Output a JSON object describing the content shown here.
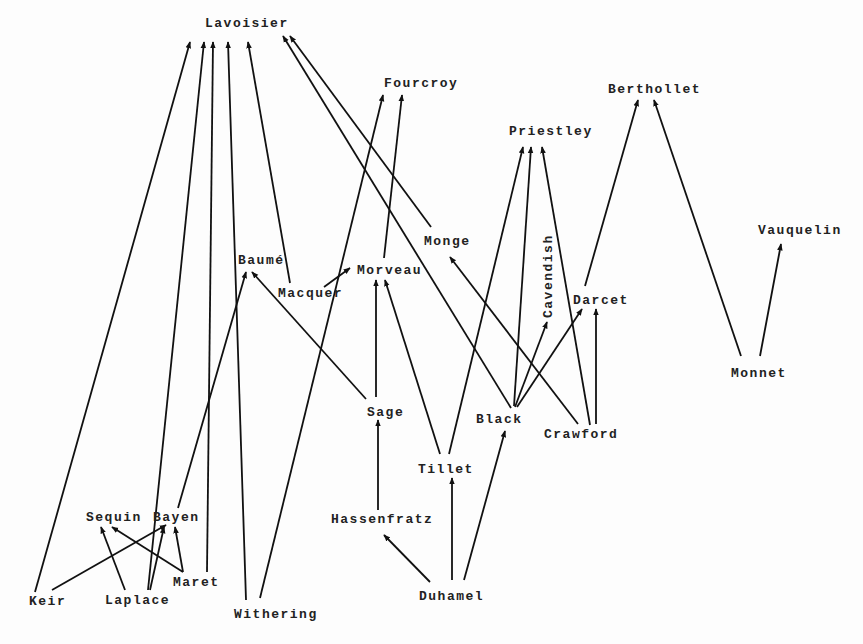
{
  "diagram": {
    "type": "directed-graph",
    "colors": {
      "background": "#fdfdfd",
      "ink": "#111111"
    },
    "nodes": [
      {
        "id": "lavoisier",
        "label": "Lavoisier",
        "x": 205,
        "y": 17
      },
      {
        "id": "fourcroy",
        "label": "Fourcroy",
        "x": 384,
        "y": 77
      },
      {
        "id": "berthollet",
        "label": "Berthollet",
        "x": 608,
        "y": 83
      },
      {
        "id": "priestley",
        "label": "Priestley",
        "x": 509,
        "y": 125
      },
      {
        "id": "vauquelin",
        "label": "Vauquelin",
        "x": 758,
        "y": 224
      },
      {
        "id": "monge",
        "label": "Monge",
        "x": 424,
        "y": 235
      },
      {
        "id": "baume",
        "label": "Baumé",
        "x": 238,
        "y": 254
      },
      {
        "id": "morveau",
        "label": "Morveau",
        "x": 357,
        "y": 264
      },
      {
        "id": "macquer",
        "label": "Macquer",
        "x": 278,
        "y": 287
      },
      {
        "id": "cavendish",
        "label": "Cavendish",
        "x": 542,
        "y": 318,
        "vertical": true
      },
      {
        "id": "darcet",
        "label": "Darcet",
        "x": 573,
        "y": 294
      },
      {
        "id": "monnet",
        "label": "Monnet",
        "x": 731,
        "y": 367
      },
      {
        "id": "sage",
        "label": "Sage",
        "x": 367,
        "y": 406
      },
      {
        "id": "black",
        "label": "Black",
        "x": 476,
        "y": 413
      },
      {
        "id": "crawford",
        "label": "Crawford",
        "x": 544,
        "y": 428
      },
      {
        "id": "tillet",
        "label": "Tillet",
        "x": 418,
        "y": 463
      },
      {
        "id": "sequin",
        "label": "Sequin",
        "x": 86,
        "y": 511
      },
      {
        "id": "bayen",
        "label": "Bayen",
        "x": 153,
        "y": 511
      },
      {
        "id": "hassenfratz",
        "label": "Hassenfratz",
        "x": 331,
        "y": 513
      },
      {
        "id": "maret",
        "label": "Maret",
        "x": 173,
        "y": 576
      },
      {
        "id": "keir",
        "label": "Keir",
        "x": 29,
        "y": 595
      },
      {
        "id": "laplace",
        "label": "Laplace",
        "x": 105,
        "y": 594
      },
      {
        "id": "duhamel",
        "label": "Duhamel",
        "x": 419,
        "y": 590
      },
      {
        "id": "withering",
        "label": "Withering",
        "x": 234,
        "y": 608
      }
    ],
    "edges": [
      {
        "from": "keir",
        "to": "lavoisier",
        "x1": 35,
        "y1": 592,
        "x2": 190,
        "y2": 42
      },
      {
        "from": "laplace",
        "to": "lavoisier",
        "x1": 148,
        "y1": 590,
        "x2": 204,
        "y2": 42
      },
      {
        "from": "maret",
        "to": "lavoisier",
        "x1": 207,
        "y1": 572,
        "x2": 213,
        "y2": 42
      },
      {
        "from": "withering",
        "to": "lavoisier",
        "x1": 246,
        "y1": 600,
        "x2": 228,
        "y2": 42
      },
      {
        "from": "macquer",
        "to": "lavoisier",
        "x1": 290,
        "y1": 283,
        "x2": 248,
        "y2": 42
      },
      {
        "from": "black",
        "to": "lavoisier",
        "x1": 511,
        "y1": 408,
        "x2": 283,
        "y2": 36
      },
      {
        "from": "monge",
        "to": "lavoisier",
        "x1": 431,
        "y1": 227,
        "x2": 290,
        "y2": 36
      },
      {
        "from": "withering",
        "to": "fourcroy",
        "x1": 260,
        "y1": 598,
        "x2": 383,
        "y2": 95
      },
      {
        "from": "morveau",
        "to": "fourcroy",
        "x1": 384,
        "y1": 258,
        "x2": 402,
        "y2": 95
      },
      {
        "from": "macquer",
        "to": "morveau",
        "x1": 324,
        "y1": 287,
        "x2": 350,
        "y2": 268
      },
      {
        "from": "sage",
        "to": "morveau",
        "x1": 376,
        "y1": 397,
        "x2": 376,
        "y2": 280
      },
      {
        "from": "tillet",
        "to": "morveau",
        "x1": 440,
        "y1": 454,
        "x2": 385,
        "y2": 280
      },
      {
        "from": "sage",
        "to": "baume",
        "x1": 366,
        "y1": 399,
        "x2": 252,
        "y2": 272
      },
      {
        "from": "bayen",
        "to": "baume",
        "x1": 178,
        "y1": 508,
        "x2": 246,
        "y2": 272
      },
      {
        "from": "tillet",
        "to": "priestley",
        "x1": 449,
        "y1": 454,
        "x2": 523,
        "y2": 147
      },
      {
        "from": "black",
        "to": "priestley",
        "x1": 514,
        "y1": 406,
        "x2": 531,
        "y2": 147
      },
      {
        "from": "crawford",
        "to": "priestley",
        "x1": 590,
        "y1": 425,
        "x2": 542,
        "y2": 147
      },
      {
        "from": "black",
        "to": "cavendish",
        "x1": 515,
        "y1": 407,
        "x2": 547,
        "y2": 322
      },
      {
        "from": "black",
        "to": "darcet",
        "x1": 517,
        "y1": 407,
        "x2": 582,
        "y2": 309
      },
      {
        "from": "crawford",
        "to": "darcet",
        "x1": 596,
        "y1": 424,
        "x2": 596,
        "y2": 309
      },
      {
        "from": "crawford",
        "to": "monge",
        "x1": 578,
        "y1": 424,
        "x2": 450,
        "y2": 257
      },
      {
        "from": "darcet",
        "to": "berthollet",
        "x1": 585,
        "y1": 286,
        "x2": 638,
        "y2": 100
      },
      {
        "from": "monnet",
        "to": "berthollet",
        "x1": 741,
        "y1": 356,
        "x2": 654,
        "y2": 100
      },
      {
        "from": "monnet",
        "to": "vauquelin",
        "x1": 760,
        "y1": 356,
        "x2": 781,
        "y2": 244
      },
      {
        "from": "duhamel",
        "to": "hassenfratz",
        "x1": 430,
        "y1": 582,
        "x2": 384,
        "y2": 535
      },
      {
        "from": "duhamel",
        "to": "tillet",
        "x1": 452,
        "y1": 580,
        "x2": 452,
        "y2": 478
      },
      {
        "from": "duhamel",
        "to": "black",
        "x1": 464,
        "y1": 580,
        "x2": 505,
        "y2": 431
      },
      {
        "from": "hassenfratz",
        "to": "sage",
        "x1": 378,
        "y1": 510,
        "x2": 378,
        "y2": 420
      },
      {
        "from": "keir",
        "to": "bayen",
        "x1": 52,
        "y1": 590,
        "x2": 166,
        "y2": 525
      },
      {
        "from": "laplace",
        "to": "sequin",
        "x1": 125,
        "y1": 590,
        "x2": 101,
        "y2": 527
      },
      {
        "from": "laplace",
        "to": "bayen",
        "x1": 150,
        "y1": 590,
        "x2": 164,
        "y2": 527
      },
      {
        "from": "maret",
        "to": "sequin",
        "x1": 183,
        "y1": 572,
        "x2": 112,
        "y2": 527
      },
      {
        "from": "maret",
        "to": "bayen",
        "x1": 183,
        "y1": 572,
        "x2": 175,
        "y2": 527
      }
    ]
  }
}
